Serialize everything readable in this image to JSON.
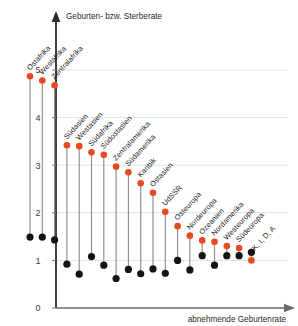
{
  "chart_data": {
    "type": "scatter",
    "title": "Geburten- bzw. Sterberate",
    "xlabel": "abnehmende Geburtenrate",
    "ylabel": "Geburten- bzw. Sterberate",
    "ylim": [
      0,
      5.4
    ],
    "yticks": [
      0,
      1,
      2,
      3,
      4,
      5
    ],
    "ytick_labels": [
      "0",
      "1",
      "2",
      "3",
      "4",
      "5"
    ],
    "grid": true,
    "legend": null,
    "categories": [
      "Ostafrika",
      "Westafrika",
      "Zentralafrika",
      "Südasien",
      "Westasien",
      "Südafrika",
      "Südostasien",
      "Zentralamerika",
      "Südamerika",
      "Karibik",
      "Ostasien",
      "UdSSR",
      "Osteuropa",
      "Nordeuropa",
      "Ozeanien",
      "Nordamerika",
      "Westeuropa",
      "Südeuropa",
      "DK, I, D, A"
    ],
    "series": [
      {
        "name": "Geburtenrate",
        "color": "#e8491f",
        "values": [
          4.87,
          4.78,
          4.68,
          3.42,
          3.4,
          3.27,
          3.22,
          2.97,
          2.85,
          2.62,
          2.42,
          2.02,
          1.72,
          1.52,
          1.42,
          1.39,
          1.3,
          1.26,
          1.0
        ]
      },
      {
        "name": "Sterberate",
        "color": "#141414",
        "values": [
          1.49,
          1.49,
          1.43,
          0.92,
          0.71,
          1.08,
          0.9,
          0.62,
          0.81,
          0.72,
          0.82,
          0.73,
          1.0,
          0.8,
          1.1,
          0.9,
          1.1,
          1.1,
          1.17
        ]
      }
    ]
  },
  "axis": {
    "y_title": "Geburten- bzw. Sterberate",
    "x_title": "abnehmende Geburtenrate"
  }
}
